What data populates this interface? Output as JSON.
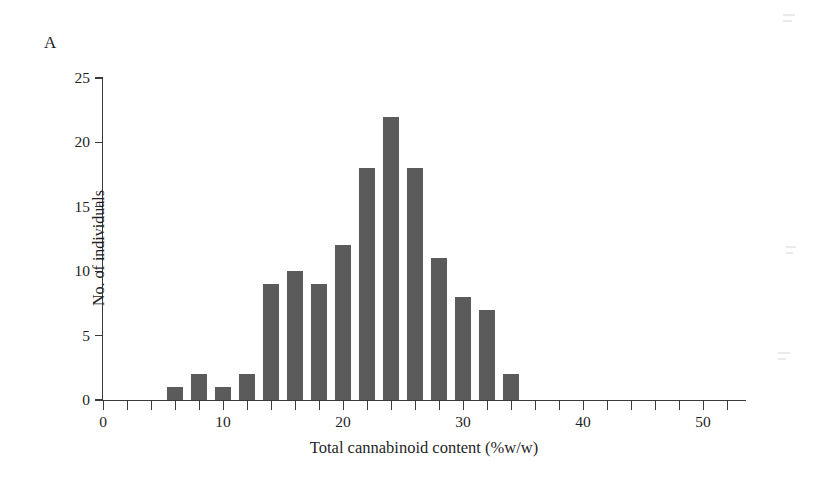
{
  "panel": {
    "label": "A"
  },
  "chart_data": {
    "type": "bar",
    "title": "",
    "subtitle": "",
    "xlabel": "Total cannabinoid content (%w/w)",
    "ylabel": "No. of individuals",
    "xlim": [
      0,
      53.5
    ],
    "ylim": [
      0,
      25
    ],
    "grid": false,
    "legend": null,
    "bar_color": "#5b5b5b",
    "axis_color": "#3b3b3b",
    "bin_width": 2,
    "bar_pixel_width": 16,
    "x_major_ticks": [
      0,
      10,
      20,
      30,
      40,
      50
    ],
    "x_minor_tick_step": 2,
    "x_tick_labels": [
      "0",
      "10",
      "20",
      "30",
      "40",
      "50"
    ],
    "y_ticks": [
      0,
      5,
      10,
      15,
      20,
      25
    ],
    "y_tick_labels": [
      "0",
      "5",
      "10",
      "15",
      "20",
      "25"
    ],
    "categories": [
      6,
      8,
      10,
      12,
      14,
      16,
      18,
      20,
      22,
      24,
      26,
      28,
      30,
      32,
      34
    ],
    "values": [
      1,
      2,
      1,
      2,
      9,
      10,
      9,
      12,
      18,
      22,
      18,
      11,
      8,
      7,
      2
    ],
    "annotations": []
  }
}
